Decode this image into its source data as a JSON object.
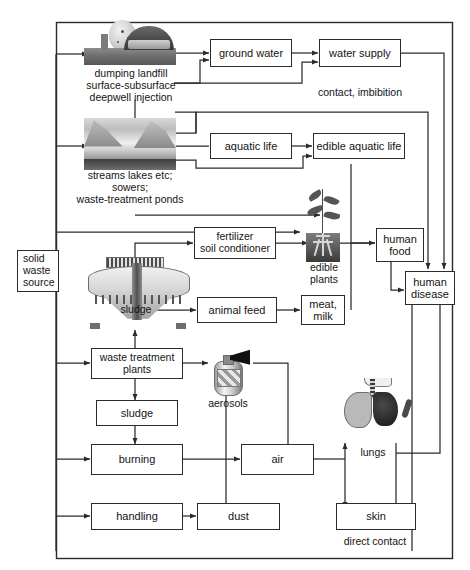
{
  "diagram": {
    "frame_label": "direct contact",
    "annotation_contact": "contact, imbibition"
  },
  "nodes": {
    "solid_waste_source": "solid\nwaste\nsource",
    "solid_waste_source_lines": [
      "solid",
      "waste",
      "source"
    ],
    "ground_water": "ground water",
    "water_supply": "water supply",
    "aquatic_life": "aquatic life",
    "edible_aquatic_life": "edible aquatic life",
    "fertilizer": "fertilizer\nsoil conditioner",
    "fertilizer_lines": [
      "fertilizer",
      "soil conditioner"
    ],
    "human_food": "human\nfood",
    "human_food_lines": [
      "human",
      "food"
    ],
    "human_disease": "human\ndisease",
    "human_disease_lines": [
      "human",
      "disease"
    ],
    "animal_feed": "animal feed",
    "meat_milk": "meat,\nmilk",
    "meat_milk_lines": [
      "meat,",
      "milk"
    ],
    "waste_treatment_plants": "waste treatment\nplants",
    "waste_treatment_plants_lines": [
      "waste treatment",
      "plants"
    ],
    "sludge_box": "sludge",
    "burning": "burning",
    "air": "air",
    "handling": "handling",
    "dust": "dust",
    "skin": "skin"
  },
  "captions": {
    "landfill": "dumping landfill\nsurface-subsurface\ndeepwell injection",
    "landfill_lines": [
      "dumping landfill",
      "surface-subsurface",
      "deepwell injection"
    ],
    "streams": "streams lakes etc;\nsowers;\nwaste-treatment ponds",
    "streams_lines": [
      "streams lakes etc;",
      "sowers;",
      "waste-treatment ponds"
    ],
    "sludge_caption": "sludge",
    "edible_plants": "edible\nplants",
    "edible_plants_lines": [
      "edible",
      "plants"
    ],
    "aerosols": "aerosols",
    "lungs": "lungs",
    "direct_contact": "direct contact"
  },
  "images": {
    "landfill_illustration": "landfill-illustration",
    "lake_illustration": "streams-lakes-illustration",
    "clarifier_illustration": "settling-tank-illustration",
    "plant_illustration": "edible-plant-illustration",
    "aerosol_illustration": "aerosol-can-illustration",
    "lungs_illustration": "lungs-torso-illustration"
  },
  "colors": {
    "line": "#2b2b2b",
    "box_border": "#2b2b2b",
    "background": "#ffffff",
    "text": "#141414"
  }
}
